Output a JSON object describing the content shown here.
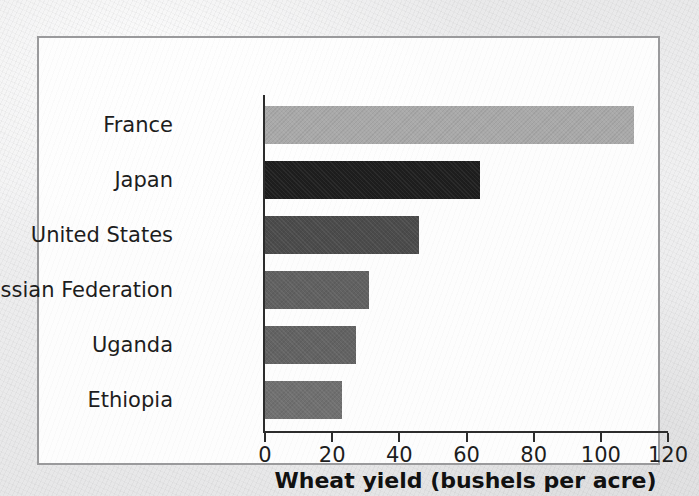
{
  "chart_data": {
    "type": "bar",
    "orientation": "horizontal",
    "title": "",
    "xlabel": "Wheat yield (bushels per acre)",
    "ylabel": "",
    "categories": [
      "France",
      "Japan",
      "United States",
      "Russian Federation",
      "Uganda",
      "Ethiopia"
    ],
    "values": [
      110,
      64,
      46,
      31,
      27,
      23
    ],
    "bar_colors": [
      "#a9a9a9",
      "#1e1e1e",
      "#4b4b4b",
      "#616161",
      "#636363",
      "#707070"
    ],
    "xlim": [
      0,
      120
    ],
    "xticks": [
      0,
      20,
      40,
      60,
      80,
      100,
      120
    ],
    "xtick_labels": [
      "0",
      "20",
      "40",
      "60",
      "80",
      "100",
      "120"
    ],
    "grid": false,
    "legend": null,
    "axis_color": "#2c2c2c",
    "plot_background": "#fdfdfd",
    "frame_border_color": "#9a9a9c"
  }
}
